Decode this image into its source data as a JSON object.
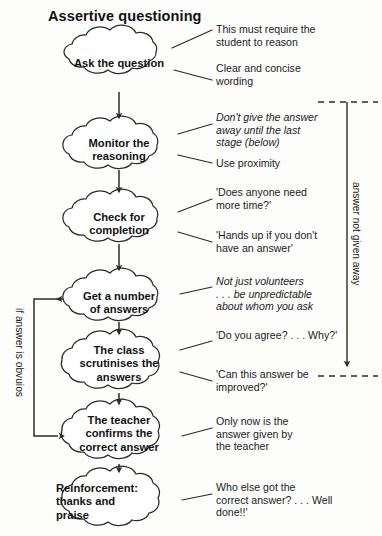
{
  "title": "Assertive questioning",
  "colors": {
    "ink": "#1a1a1a",
    "stroke": "#2b2b2b",
    "background": "#fdfdfc"
  },
  "nodes": [
    {
      "id": "ask",
      "label": "Ask the question"
    },
    {
      "id": "monitor",
      "label": "Monitor the\nreasoning"
    },
    {
      "id": "check",
      "label": "Check for\ncompletion"
    },
    {
      "id": "getanswers",
      "label": "Get a number\nof answers"
    },
    {
      "id": "scrutinise",
      "label": "The class\nscrutinises the\nanswers"
    },
    {
      "id": "confirm",
      "label": "The teacher\nconfirms the\ncorrect answer"
    },
    {
      "id": "reinforcement",
      "label": "Reinforcement:\nthanks and\npraise"
    }
  ],
  "annotations": [
    {
      "id": "a1",
      "text": "This must require the\nstudent to reason",
      "italic": false
    },
    {
      "id": "a2",
      "text": "Clear and concise\nwording",
      "italic": false
    },
    {
      "id": "a3",
      "text": "Don't give the answer\naway until the last\nstage (below)",
      "italic": true
    },
    {
      "id": "a4",
      "text": "Use proximity",
      "italic": false
    },
    {
      "id": "a5",
      "text": "'Does anyone need\nmore time?'",
      "italic": false
    },
    {
      "id": "a6",
      "text": "'Hands up if you don't\nhave an answer'",
      "italic": false
    },
    {
      "id": "a7",
      "text": "Not just volunteers\n. . . be unpredictable\nabout whom you ask",
      "italic": true
    },
    {
      "id": "a8",
      "text": "'Do you agree? . . . Why?'",
      "italic": false
    },
    {
      "id": "a9",
      "text": "'Can this answer be\nimproved?'",
      "italic": false
    },
    {
      "id": "a10",
      "text": "Only now is the\nanswer given by\nthe teacher",
      "italic": false
    },
    {
      "id": "a11",
      "text": "Who else got the\ncorrect answer? . . . Well\ndone!!'",
      "italic": false
    }
  ],
  "side_labels": {
    "right_bracket": "answer not given away",
    "left_loop": "if answer is obvuios"
  }
}
